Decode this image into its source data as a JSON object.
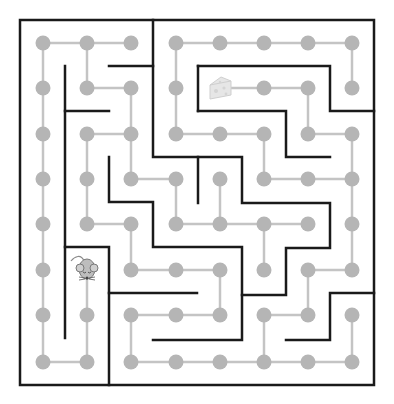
{
  "game": {
    "title": "Mouse maze",
    "goal_label": "cheese",
    "player_label": "mouse"
  },
  "colors": {
    "background": "#ffffff",
    "wall": "#1a1a1a",
    "path": "#c4c4c4",
    "dot": "#b5b5b5",
    "cheese": "#e6e6e6",
    "mouse": "#bdbdbd"
  },
  "grid": {
    "cols": 8,
    "rows": 8,
    "col_x": [
      43,
      87,
      131,
      176,
      220,
      264,
      308,
      352
    ],
    "row_y": [
      43,
      88,
      134,
      179,
      224,
      270,
      315,
      362
    ],
    "dot_radius": 7.5
  },
  "player": {
    "col": 1,
    "row": 5
  },
  "goal": {
    "col": 4,
    "row": 1
  },
  "path_edges": [
    [
      [
        0,
        0
      ],
      [
        1,
        0
      ]
    ],
    [
      [
        1,
        0
      ],
      [
        2,
        0
      ]
    ],
    [
      [
        0,
        0
      ],
      [
        0,
        1
      ]
    ],
    [
      [
        1,
        0
      ],
      [
        1,
        1
      ]
    ],
    [
      [
        3,
        0
      ],
      [
        4,
        0
      ]
    ],
    [
      [
        4,
        0
      ],
      [
        5,
        0
      ]
    ],
    [
      [
        5,
        0
      ],
      [
        6,
        0
      ]
    ],
    [
      [
        6,
        0
      ],
      [
        7,
        0
      ]
    ],
    [
      [
        3,
        0
      ],
      [
        3,
        1
      ]
    ],
    [
      [
        7,
        0
      ],
      [
        7,
        1
      ]
    ],
    [
      [
        1,
        1
      ],
      [
        2,
        1
      ]
    ],
    [
      [
        2,
        1
      ],
      [
        2,
        2
      ]
    ],
    [
      [
        0,
        1
      ],
      [
        0,
        2
      ]
    ],
    [
      [
        3,
        1
      ],
      [
        3,
        2
      ]
    ],
    [
      [
        4,
        1
      ],
      [
        5,
        1
      ]
    ],
    [
      [
        5,
        1
      ],
      [
        6,
        1
      ]
    ],
    [
      [
        6,
        1
      ],
      [
        6,
        2
      ]
    ],
    [
      [
        1,
        2
      ],
      [
        2,
        2
      ]
    ],
    [
      [
        1,
        2
      ],
      [
        1,
        3
      ]
    ],
    [
      [
        2,
        2
      ],
      [
        2,
        3
      ]
    ],
    [
      [
        0,
        2
      ],
      [
        0,
        3
      ]
    ],
    [
      [
        3,
        2
      ],
      [
        4,
        2
      ]
    ],
    [
      [
        4,
        2
      ],
      [
        5,
        2
      ]
    ],
    [
      [
        5,
        2
      ],
      [
        5,
        3
      ]
    ],
    [
      [
        6,
        2
      ],
      [
        7,
        2
      ]
    ],
    [
      [
        7,
        2
      ],
      [
        7,
        3
      ]
    ],
    [
      [
        2,
        3
      ],
      [
        3,
        3
      ]
    ],
    [
      [
        3,
        3
      ],
      [
        3,
        4
      ]
    ],
    [
      [
        4,
        3
      ],
      [
        4,
        4
      ]
    ],
    [
      [
        1,
        3
      ],
      [
        1,
        4
      ]
    ],
    [
      [
        0,
        3
      ],
      [
        0,
        4
      ]
    ],
    [
      [
        5,
        3
      ],
      [
        6,
        3
      ]
    ],
    [
      [
        6,
        3
      ],
      [
        7,
        3
      ]
    ],
    [
      [
        7,
        3
      ],
      [
        7,
        4
      ]
    ],
    [
      [
        1,
        4
      ],
      [
        2,
        4
      ]
    ],
    [
      [
        2,
        4
      ],
      [
        2,
        5
      ]
    ],
    [
      [
        0,
        4
      ],
      [
        0,
        5
      ]
    ],
    [
      [
        3,
        4
      ],
      [
        4,
        4
      ]
    ],
    [
      [
        4,
        4
      ],
      [
        5,
        4
      ]
    ],
    [
      [
        5,
        4
      ],
      [
        6,
        4
      ]
    ],
    [
      [
        5,
        4
      ],
      [
        5,
        5
      ]
    ],
    [
      [
        7,
        4
      ],
      [
        7,
        5
      ]
    ],
    [
      [
        0,
        5
      ],
      [
        0,
        6
      ]
    ],
    [
      [
        1,
        5
      ],
      [
        1,
        6
      ]
    ],
    [
      [
        2,
        5
      ],
      [
        3,
        5
      ]
    ],
    [
      [
        3,
        5
      ],
      [
        4,
        5
      ]
    ],
    [
      [
        4,
        5
      ],
      [
        4,
        6
      ]
    ],
    [
      [
        6,
        5
      ],
      [
        7,
        5
      ]
    ],
    [
      [
        6,
        5
      ],
      [
        6,
        6
      ]
    ],
    [
      [
        0,
        6
      ],
      [
        0,
        7
      ]
    ],
    [
      [
        1,
        6
      ],
      [
        1,
        7
      ]
    ],
    [
      [
        2,
        6
      ],
      [
        3,
        6
      ]
    ],
    [
      [
        3,
        6
      ],
      [
        4,
        6
      ]
    ],
    [
      [
        2,
        6
      ],
      [
        2,
        7
      ]
    ],
    [
      [
        5,
        6
      ],
      [
        6,
        6
      ]
    ],
    [
      [
        5,
        6
      ],
      [
        5,
        7
      ]
    ],
    [
      [
        7,
        6
      ],
      [
        7,
        7
      ]
    ],
    [
      [
        0,
        7
      ],
      [
        1,
        7
      ]
    ],
    [
      [
        2,
        7
      ],
      [
        3,
        7
      ]
    ],
    [
      [
        3,
        7
      ],
      [
        4,
        7
      ]
    ],
    [
      [
        4,
        7
      ],
      [
        5,
        7
      ]
    ],
    [
      [
        5,
        7
      ],
      [
        6,
        7
      ]
    ],
    [
      [
        6,
        7
      ],
      [
        7,
        7
      ]
    ]
  ],
  "walls": [
    [
      [
        20,
        20
      ],
      [
        374,
        20
      ],
      [
        374,
        385
      ],
      [
        20,
        385
      ],
      [
        20,
        20
      ]
    ],
    [
      [
        153,
        20
      ],
      [
        153,
        157
      ],
      [
        242,
        157
      ],
      [
        242,
        203
      ],
      [
        330,
        203
      ],
      [
        330,
        248
      ],
      [
        286,
        248
      ],
      [
        286,
        295
      ],
      [
        242,
        295
      ]
    ],
    [
      [
        109,
        66
      ],
      [
        153,
        66
      ]
    ],
    [
      [
        65,
        66
      ],
      [
        65,
        338
      ]
    ],
    [
      [
        65,
        111
      ],
      [
        109,
        111
      ]
    ],
    [
      [
        198,
        66
      ],
      [
        198,
        111
      ]
    ],
    [
      [
        198,
        66
      ],
      [
        330,
        66
      ],
      [
        330,
        111
      ],
      [
        374,
        111
      ]
    ],
    [
      [
        198,
        111
      ],
      [
        286,
        111
      ],
      [
        286,
        157
      ],
      [
        330,
        157
      ]
    ],
    [
      [
        109,
        157
      ],
      [
        109,
        202
      ],
      [
        153,
        202
      ],
      [
        153,
        247
      ],
      [
        242,
        247
      ],
      [
        242,
        340
      ],
      [
        153,
        340
      ]
    ],
    [
      [
        198,
        157
      ],
      [
        198,
        203
      ]
    ],
    [
      [
        65,
        247
      ],
      [
        109,
        247
      ],
      [
        109,
        385
      ]
    ],
    [
      [
        109,
        293
      ],
      [
        197,
        293
      ]
    ],
    [
      [
        374,
        293
      ],
      [
        330,
        293
      ],
      [
        330,
        340
      ],
      [
        286,
        340
      ]
    ]
  ]
}
